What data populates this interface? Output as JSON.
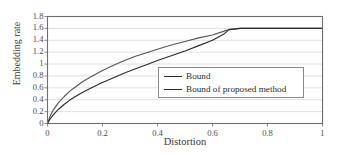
{
  "chart_data": {
    "type": "line",
    "title": "",
    "xlabel": "Distortion",
    "ylabel": "Embedding rate",
    "xlim": [
      0,
      1
    ],
    "ylim": [
      0,
      1.8
    ],
    "grid": true,
    "grid_axis": "y",
    "legend_position": "center-right",
    "xticks": [
      "0",
      "0.2",
      "0.4",
      "0.6",
      "0.8",
      "1"
    ],
    "xtick_values": [
      0,
      0.2,
      0.4,
      0.6,
      0.8,
      1
    ],
    "yticks": [
      "0",
      "0.2",
      "0.4",
      "0.6",
      "0.8",
      "1",
      "1.2",
      "1.4",
      "1.6",
      "1.8"
    ],
    "ytick_values": [
      0,
      0.2,
      0.4,
      0.6,
      0.8,
      1.0,
      1.2,
      1.4,
      1.6,
      1.8
    ],
    "saturation_value": 1.6,
    "saturation_x": 0.66,
    "series": [
      {
        "name": "Bound",
        "color": "#555555",
        "x": [
          0,
          0.01,
          0.02,
          0.04,
          0.06,
          0.08,
          0.1,
          0.13,
          0.16,
          0.2,
          0.24,
          0.28,
          0.32,
          0.36,
          0.4,
          0.45,
          0.5,
          0.55,
          0.6,
          0.64,
          0.66,
          0.7,
          0.8,
          0.9,
          1.0
        ],
        "y": [
          0,
          0.13,
          0.22,
          0.35,
          0.45,
          0.54,
          0.61,
          0.71,
          0.79,
          0.89,
          0.98,
          1.06,
          1.13,
          1.19,
          1.25,
          1.32,
          1.38,
          1.44,
          1.49,
          1.55,
          1.58,
          1.6,
          1.6,
          1.6,
          1.6
        ]
      },
      {
        "name": "Bound of proposed method",
        "color": "#2b2b2b",
        "x": [
          0,
          0.01,
          0.02,
          0.04,
          0.06,
          0.08,
          0.1,
          0.13,
          0.16,
          0.2,
          0.24,
          0.28,
          0.32,
          0.36,
          0.4,
          0.45,
          0.5,
          0.55,
          0.6,
          0.64,
          0.66,
          0.7,
          0.8,
          0.9,
          1.0
        ],
        "y": [
          0,
          0.08,
          0.14,
          0.24,
          0.32,
          0.39,
          0.45,
          0.53,
          0.6,
          0.69,
          0.77,
          0.85,
          0.92,
          0.99,
          1.06,
          1.14,
          1.22,
          1.31,
          1.4,
          1.5,
          1.58,
          1.6,
          1.6,
          1.6,
          1.6
        ]
      }
    ]
  },
  "axes": {
    "frame_color": "#6e6e6e",
    "grid_color": "#d8d8d8",
    "background": "#ffffff"
  },
  "legend": {
    "entries": [
      {
        "label": "Bound"
      },
      {
        "label": "Bound of proposed method"
      }
    ]
  }
}
